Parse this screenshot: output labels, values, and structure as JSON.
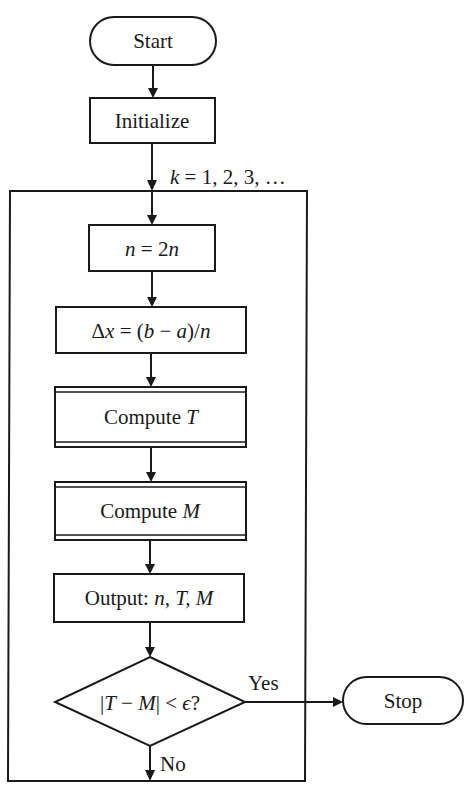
{
  "flowchart": {
    "start": {
      "label": "Start"
    },
    "initialize": {
      "label": "Initialize"
    },
    "loop_label": {
      "var": "k",
      "rest": " = 1, 2, 3, …"
    },
    "double_n": {
      "lhs": "n",
      "op": " = 2",
      "rhs": "n"
    },
    "delta_x": {
      "p1": "Δ",
      "x": "x",
      "p2": " = (",
      "b": "b",
      "minus": " − ",
      "a": "a",
      "p3": ")/",
      "n": "n"
    },
    "compute_t": {
      "text": "Compute ",
      "var": "T"
    },
    "compute_m": {
      "text": "Compute ",
      "var": "M"
    },
    "output": {
      "text": "Output: ",
      "vars": "n, T, M"
    },
    "decision": {
      "bar1": "|",
      "t": "T",
      "minus": " − ",
      "m": "M",
      "bar2": "| < ",
      "eps": "ϵ",
      "q": "?"
    },
    "yes_label": "Yes",
    "no_label": "No",
    "stop": {
      "label": "Stop"
    }
  },
  "colors": {
    "ink": "#1a1a1a",
    "paper": "#ffffff"
  }
}
